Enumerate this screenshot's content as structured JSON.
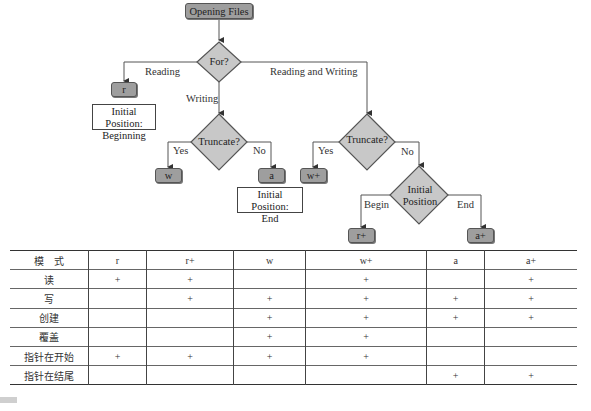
{
  "flowchart": {
    "start": "Opening Files",
    "decision_for": "For?",
    "edge_reading": "Reading",
    "edge_writing": "Writing",
    "edge_reading_writing": "Reading and Writing",
    "mode_r": "r",
    "note_beginning_line1": "Initial Position:",
    "note_beginning_line2": "Beginning",
    "decision_truncate_write": "Truncate?",
    "edge_yes_1": "Yes",
    "edge_no_1": "No",
    "mode_w": "w",
    "mode_a": "a",
    "note_end_line1": "Initial Position:",
    "note_end_line2": "End",
    "decision_truncate_rw": "Truncate?",
    "edge_yes_2": "Yes",
    "edge_no_2": "No",
    "mode_w_plus": "w+",
    "decision_position_line1": "Initial",
    "decision_position_line2": "Position",
    "edge_begin": "Begin",
    "edge_end": "End",
    "mode_r_plus": "r+",
    "mode_a_plus": "a+",
    "colors": {
      "node_fill": "#9e9e9e",
      "diamond_fill": "#c8c8c8",
      "line": "#555555"
    }
  },
  "table": {
    "headers": [
      "模　式",
      "r",
      "r+",
      "w",
      "w+",
      "a",
      "a+"
    ],
    "rows": [
      [
        "读",
        "+",
        "+",
        "",
        "+",
        "",
        "+"
      ],
      [
        "写",
        "",
        "+",
        "+",
        "+",
        "+",
        "+"
      ],
      [
        "创建",
        "",
        "",
        "+",
        "+",
        "+",
        "+"
      ],
      [
        "覆盖",
        "",
        "",
        "+",
        "+",
        "",
        ""
      ],
      [
        "指针在开始",
        "+",
        "+",
        "+",
        "+",
        "",
        ""
      ],
      [
        "指针在结尾",
        "",
        "",
        "",
        "",
        "+",
        "+"
      ]
    ]
  }
}
